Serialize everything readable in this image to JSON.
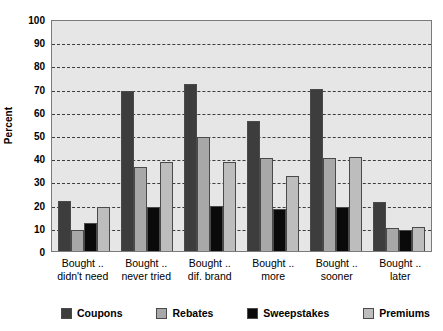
{
  "chart_data": {
    "type": "bar",
    "title": "",
    "subtitle": "",
    "xlabel": "",
    "ylabel": "Percent",
    "ylim": [
      0,
      100
    ],
    "ytick_step": 10,
    "yticks": [
      100,
      90,
      80,
      70,
      60,
      50,
      40,
      30,
      20,
      10,
      0
    ],
    "grid": true,
    "grid_style": "dashed-horizontal",
    "legend_position": "bottom",
    "categories": [
      "Bought .. didn't need",
      "Bought .. never tried",
      "Bought .. dif. brand",
      "Bought .. more",
      "Bought .. sooner",
      "Bought .. later"
    ],
    "category_lines": [
      [
        "Bought ..",
        "didn't need"
      ],
      [
        "Bought ..",
        "never tried"
      ],
      [
        "Bought ..",
        "dif. brand"
      ],
      [
        "Bought ..",
        "more"
      ],
      [
        "Bought ..",
        "sooner"
      ],
      [
        "Bought ..",
        "later"
      ]
    ],
    "series": [
      {
        "name": "Coupons",
        "color": "#3d3d3d",
        "values": [
          21.5,
          69,
          72,
          56,
          70,
          21
        ]
      },
      {
        "name": "Rebates",
        "color": "#a8a8a8",
        "values": [
          9,
          36,
          49,
          40,
          40,
          10
        ]
      },
      {
        "name": "Sweepstakes",
        "color": "#0a0a0a",
        "values": [
          12,
          19,
          19.5,
          18,
          19,
          9
        ]
      },
      {
        "name": "Premiums",
        "color": "#bdbdbd",
        "values": [
          19,
          38.5,
          38.5,
          32.5,
          40.5,
          10.5
        ]
      }
    ]
  }
}
